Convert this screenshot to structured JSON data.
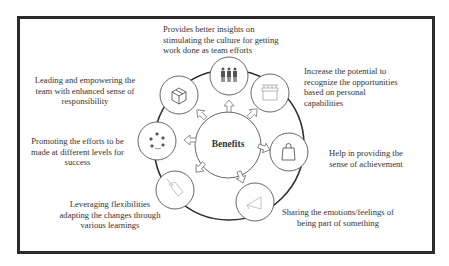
{
  "center": {
    "label": "Benefits"
  },
  "benefits": [
    {
      "id": "top",
      "icon": "team-icon",
      "lines": [
        "Provides better insights on",
        "stimulating the culture for getting",
        "work done as team efforts"
      ]
    },
    {
      "id": "top-right",
      "icon": "store-icon",
      "lines": [
        "Increase the potential to",
        "recognize the opportunities",
        "based on personal",
        "capabilities"
      ]
    },
    {
      "id": "right",
      "icon": "shopping-bag-icon",
      "lines": [
        "Help in providing the",
        "sense of achievement"
      ]
    },
    {
      "id": "bottom-right",
      "icon": "megaphone-icon",
      "lines": [
        "Sharing the emotions/feelings of",
        "being part of something"
      ]
    },
    {
      "id": "bottom-left",
      "icon": "price-tag-icon",
      "lines": [
        "Leveraging flexibilities",
        "adapting the changes through",
        "various learnings"
      ]
    },
    {
      "id": "left",
      "icon": "cycle-icon",
      "lines": [
        "Promoting the efforts to be",
        "made at different levels for",
        "success"
      ]
    },
    {
      "id": "top-left",
      "icon": "box-icon",
      "lines": [
        "Leading and empowering the",
        "team with enhanced sense of",
        "responsibility"
      ]
    }
  ]
}
